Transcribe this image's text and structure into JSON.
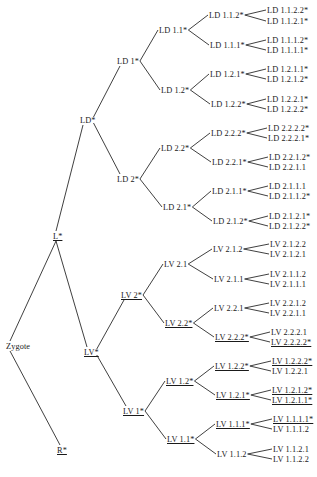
{
  "diagram": {
    "type": "cell-lineage-tree",
    "root": "Zygote",
    "nodes": [
      {
        "id": "zygote",
        "label": "Zygote",
        "x": 6,
        "y": 346,
        "underline": false
      },
      {
        "id": "L",
        "label": "L*",
        "x": 53,
        "y": 236,
        "underline": true
      },
      {
        "id": "R",
        "label": "R*",
        "x": 57,
        "y": 450,
        "underline": true
      },
      {
        "id": "LD",
        "label": "LD*",
        "x": 80,
        "y": 120,
        "underline": false
      },
      {
        "id": "LV",
        "label": "LV*",
        "x": 84,
        "y": 352,
        "underline": true
      },
      {
        "id": "LD1",
        "label": "LD 1*",
        "x": 117,
        "y": 61,
        "underline": false
      },
      {
        "id": "LD2",
        "label": "LD 2*",
        "x": 117,
        "y": 179,
        "underline": false
      },
      {
        "id": "LV2",
        "label": "LV 2*",
        "x": 121,
        "y": 295,
        "underline": true
      },
      {
        "id": "LV1",
        "label": "LV 1*",
        "x": 123,
        "y": 411,
        "underline": true
      },
      {
        "id": "LD1.1",
        "label": "LD 1.1*",
        "x": 159,
        "y": 30,
        "underline": false
      },
      {
        "id": "LD1.2",
        "label": "LD 1.2*",
        "x": 161,
        "y": 90,
        "underline": false
      },
      {
        "id": "LD2.2",
        "label": "LD 2.2*",
        "x": 161,
        "y": 148,
        "underline": false
      },
      {
        "id": "LD2.1",
        "label": "LD 2.1*",
        "x": 163,
        "y": 207,
        "underline": false
      },
      {
        "id": "LV2.1",
        "label": "LV 2.1",
        "x": 164,
        "y": 264,
        "underline": false
      },
      {
        "id": "LV2.2",
        "label": "LV 2.2*",
        "x": 165,
        "y": 323,
        "underline": true
      },
      {
        "id": "LV1.2",
        "label": "LV 1.2*",
        "x": 166,
        "y": 381,
        "underline": true
      },
      {
        "id": "LV1.1",
        "label": "LV 1.1*",
        "x": 167,
        "y": 439,
        "underline": true
      },
      {
        "id": "LD1.1.2",
        "label": "LD 1.1.2*",
        "x": 209,
        "y": 15,
        "underline": false
      },
      {
        "id": "LD1.1.1",
        "label": "LD 1.1.1*",
        "x": 210,
        "y": 45,
        "underline": false
      },
      {
        "id": "LD1.2.1",
        "label": "LD 1.2.1*",
        "x": 210,
        "y": 74,
        "underline": false
      },
      {
        "id": "LD1.2.2",
        "label": "LD 1.2.2*",
        "x": 211,
        "y": 104,
        "underline": false
      },
      {
        "id": "LD2.2.2",
        "label": "LD 2.2.2*",
        "x": 211,
        "y": 133,
        "underline": false
      },
      {
        "id": "LD2.2.1",
        "label": "LD 2.2.1*",
        "x": 212,
        "y": 162,
        "underline": false
      },
      {
        "id": "LD2.1.1",
        "label": "LD 2.1.1*",
        "x": 212,
        "y": 191,
        "underline": false
      },
      {
        "id": "LD2.1.2",
        "label": "LD 2.1.2*",
        "x": 213,
        "y": 221,
        "underline": false
      },
      {
        "id": "LV2.1.2",
        "label": "LV 2.1.2",
        "x": 213,
        "y": 249,
        "underline": false
      },
      {
        "id": "LV2.1.1",
        "label": "LV 2.1.1",
        "x": 214,
        "y": 279,
        "underline": false
      },
      {
        "id": "LV2.2.1",
        "label": "LV 2.2.1",
        "x": 214,
        "y": 308,
        "underline": false
      },
      {
        "id": "LV2.2.2",
        "label": "LV 2.2.2*",
        "x": 215,
        "y": 337,
        "underline": true
      },
      {
        "id": "LV1.2.2",
        "label": "LV 1.2.2*",
        "x": 215,
        "y": 366,
        "underline": true
      },
      {
        "id": "LV1.2.1",
        "label": "LV 1.2.1*",
        "x": 216,
        "y": 395,
        "underline": true
      },
      {
        "id": "LV1.1.1",
        "label": "LV 1.1.1*",
        "x": 216,
        "y": 424,
        "underline": true
      },
      {
        "id": "LV1.1.2",
        "label": "LV 1.1.2",
        "x": 217,
        "y": 454,
        "underline": false
      },
      {
        "id": "LD1.1.2.2",
        "label": "LD 1.1.2.2*",
        "x": 267,
        "y": 10,
        "underline": false
      },
      {
        "id": "LD1.1.2.1",
        "label": "LD 1.1.2.1*",
        "x": 267,
        "y": 21,
        "underline": false
      },
      {
        "id": "LD1.1.1.2",
        "label": "LD 1.1.1.2*",
        "x": 267,
        "y": 40,
        "underline": false
      },
      {
        "id": "LD1.1.1.1",
        "label": "LD 1.1.1.1*",
        "x": 267,
        "y": 50,
        "underline": false
      },
      {
        "id": "LD1.2.1.1",
        "label": "LD 1.2.1.1*",
        "x": 267,
        "y": 69,
        "underline": false
      },
      {
        "id": "LD1.2.1.2",
        "label": "LD 1.2.1.2*",
        "x": 267,
        "y": 79,
        "underline": false
      },
      {
        "id": "LD1.2.2.1",
        "label": "LD 1.2.2.1*",
        "x": 267,
        "y": 99,
        "underline": false
      },
      {
        "id": "LD1.2.2.2",
        "label": "LD 1.2.2.2*",
        "x": 267,
        "y": 109,
        "underline": false
      },
      {
        "id": "LD2.2.2.2",
        "label": "LD 2.2.2.2*",
        "x": 268,
        "y": 128,
        "underline": false
      },
      {
        "id": "LD2.2.2.1",
        "label": "LD 2.2.2.1*",
        "x": 268,
        "y": 138,
        "underline": false
      },
      {
        "id": "LD2.2.1.2",
        "label": "LD 2.2.1.2*",
        "x": 269,
        "y": 157,
        "underline": false
      },
      {
        "id": "LD2.2.1.1",
        "label": "LD 2.2.1.1",
        "x": 269,
        "y": 167,
        "underline": false
      },
      {
        "id": "LD2.1.1.1",
        "label": "LD 2.1.1.1",
        "x": 269,
        "y": 186,
        "underline": false
      },
      {
        "id": "LD2.1.1.2",
        "label": "LD 2.1.1.2*",
        "x": 269,
        "y": 196,
        "underline": false
      },
      {
        "id": "LD2.1.2.1",
        "label": "LD 2.1.2.1*",
        "x": 269,
        "y": 216,
        "underline": false
      },
      {
        "id": "LD2.1.2.2",
        "label": "LD 2.1.2.2*",
        "x": 269,
        "y": 226,
        "underline": false
      },
      {
        "id": "LV2.1.2.2",
        "label": "LV 2.1.2.2",
        "x": 270,
        "y": 244,
        "underline": false
      },
      {
        "id": "LV2.1.2.1",
        "label": "LV 2.1.2.1",
        "x": 270,
        "y": 254,
        "underline": false
      },
      {
        "id": "LV2.1.1.2",
        "label": "LV 2.1.1.2",
        "x": 270,
        "y": 274,
        "underline": false
      },
      {
        "id": "LV2.1.1.1",
        "label": "LV 2.1.1.1",
        "x": 270,
        "y": 284,
        "underline": false
      },
      {
        "id": "LV2.2.1.2",
        "label": "LV 2.2.1.2",
        "x": 270,
        "y": 303,
        "underline": false
      },
      {
        "id": "LV2.2.1.1",
        "label": "LV 2.2.1.1",
        "x": 270,
        "y": 313,
        "underline": false
      },
      {
        "id": "LV2.2.2.1",
        "label": "LV 2.2.2.1",
        "x": 271,
        "y": 332,
        "underline": false
      },
      {
        "id": "LV2.2.2.2",
        "label": "LV 2.2.2.2*",
        "x": 271,
        "y": 342,
        "underline": true
      },
      {
        "id": "LV1.2.2.2",
        "label": "LV 1.2.2.2*",
        "x": 272,
        "y": 361,
        "underline": true
      },
      {
        "id": "LV1.2.2.1",
        "label": "LV 1.2.2.1",
        "x": 272,
        "y": 371,
        "underline": false
      },
      {
        "id": "LV1.2.1.2",
        "label": "LV 1.2.1.2*",
        "x": 272,
        "y": 390,
        "underline": true
      },
      {
        "id": "LV1.2.1.1",
        "label": "LV 1.2.1.1*",
        "x": 272,
        "y": 400,
        "underline": true
      },
      {
        "id": "LV1.1.1.1",
        "label": "LV 1.1.1.1*",
        "x": 273,
        "y": 419,
        "underline": true
      },
      {
        "id": "LV1.1.1.2",
        "label": "LV 1.1.1.2",
        "x": 273,
        "y": 429,
        "underline": false
      },
      {
        "id": "LV1.1.2.1",
        "label": "LV 1.1.2.1",
        "x": 273,
        "y": 449,
        "underline": false
      },
      {
        "id": "LV1.1.2.2",
        "label": "LV 1.1.2.2",
        "x": 273,
        "y": 459,
        "underline": false
      }
    ],
    "edges": [
      [
        "zygote",
        "L"
      ],
      [
        "zygote",
        "R"
      ],
      [
        "L",
        "LD"
      ],
      [
        "L",
        "LV"
      ],
      [
        "LD",
        "LD1"
      ],
      [
        "LD",
        "LD2"
      ],
      [
        "LV",
        "LV2"
      ],
      [
        "LV",
        "LV1"
      ],
      [
        "LD1",
        "LD1.1"
      ],
      [
        "LD1",
        "LD1.2"
      ],
      [
        "LD2",
        "LD2.2"
      ],
      [
        "LD2",
        "LD2.1"
      ],
      [
        "LV2",
        "LV2.1"
      ],
      [
        "LV2",
        "LV2.2"
      ],
      [
        "LV1",
        "LV1.2"
      ],
      [
        "LV1",
        "LV1.1"
      ],
      [
        "LD1.1",
        "LD1.1.2"
      ],
      [
        "LD1.1",
        "LD1.1.1"
      ],
      [
        "LD1.2",
        "LD1.2.1"
      ],
      [
        "LD1.2",
        "LD1.2.2"
      ],
      [
        "LD2.2",
        "LD2.2.2"
      ],
      [
        "LD2.2",
        "LD2.2.1"
      ],
      [
        "LD2.1",
        "LD2.1.1"
      ],
      [
        "LD2.1",
        "LD2.1.2"
      ],
      [
        "LV2.1",
        "LV2.1.2"
      ],
      [
        "LV2.1",
        "LV2.1.1"
      ],
      [
        "LV2.2",
        "LV2.2.1"
      ],
      [
        "LV2.2",
        "LV2.2.2"
      ],
      [
        "LV1.2",
        "LV1.2.2"
      ],
      [
        "LV1.2",
        "LV1.2.1"
      ],
      [
        "LV1.1",
        "LV1.1.1"
      ],
      [
        "LV1.1",
        "LV1.1.2"
      ],
      [
        "LD1.1.2",
        "LD1.1.2.2"
      ],
      [
        "LD1.1.2",
        "LD1.1.2.1"
      ],
      [
        "LD1.1.1",
        "LD1.1.1.2"
      ],
      [
        "LD1.1.1",
        "LD1.1.1.1"
      ],
      [
        "LD1.2.1",
        "LD1.2.1.1"
      ],
      [
        "LD1.2.1",
        "LD1.2.1.2"
      ],
      [
        "LD1.2.2",
        "LD1.2.2.1"
      ],
      [
        "LD1.2.2",
        "LD1.2.2.2"
      ],
      [
        "LD2.2.2",
        "LD2.2.2.2"
      ],
      [
        "LD2.2.2",
        "LD2.2.2.1"
      ],
      [
        "LD2.2.1",
        "LD2.2.1.2"
      ],
      [
        "LD2.2.1",
        "LD2.2.1.1"
      ],
      [
        "LD2.1.1",
        "LD2.1.1.1"
      ],
      [
        "LD2.1.1",
        "LD2.1.1.2"
      ],
      [
        "LD2.1.2",
        "LD2.1.2.1"
      ],
      [
        "LD2.1.2",
        "LD2.1.2.2"
      ],
      [
        "LV2.1.2",
        "LV2.1.2.2"
      ],
      [
        "LV2.1.2",
        "LV2.1.2.1"
      ],
      [
        "LV2.1.1",
        "LV2.1.1.2"
      ],
      [
        "LV2.1.1",
        "LV2.1.1.1"
      ],
      [
        "LV2.2.1",
        "LV2.2.1.2"
      ],
      [
        "LV2.2.1",
        "LV2.2.1.1"
      ],
      [
        "LV2.2.2",
        "LV2.2.2.1"
      ],
      [
        "LV2.2.2",
        "LV2.2.2.2"
      ],
      [
        "LV1.2.2",
        "LV1.2.2.2"
      ],
      [
        "LV1.2.2",
        "LV1.2.2.1"
      ],
      [
        "LV1.2.1",
        "LV1.2.1.2"
      ],
      [
        "LV1.2.1",
        "LV1.2.1.1"
      ],
      [
        "LV1.1.1",
        "LV1.1.1.1"
      ],
      [
        "LV1.1.1",
        "LV1.1.1.2"
      ],
      [
        "LV1.1.2",
        "LV1.1.2.1"
      ],
      [
        "LV1.1.2",
        "LV1.1.2.2"
      ]
    ]
  },
  "colors": {
    "line": "#2a2a2a",
    "text": "#1a1a1a",
    "background": "#ffffff"
  }
}
